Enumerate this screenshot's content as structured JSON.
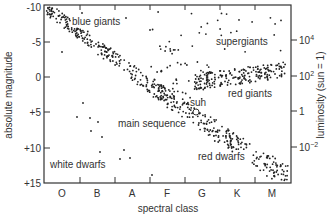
{
  "chart_data": {
    "type": "scatter",
    "xlabel": "spectral class",
    "ylabel_left": "absolute magnitude",
    "ylabel_right": "luminosity (sun = 1)",
    "x_categories": [
      "O",
      "B",
      "A",
      "F",
      "G",
      "K",
      "M"
    ],
    "y_left_ticks": [
      "-10",
      "-5",
      "0",
      "+5",
      "+10",
      "+15"
    ],
    "y_right_ticks": [
      {
        "base": "10",
        "exp": "4"
      },
      {
        "base": "10",
        "exp": "2"
      },
      {
        "base": "1",
        "exp": ""
      },
      {
        "base": "10",
        "exp": "−2"
      }
    ],
    "ylim_left": [
      -10,
      15
    ],
    "annotations": {
      "blue_giants": "blue giants",
      "supergiants": "supergiants",
      "red_giants": "red giants",
      "sun": "sun",
      "main_sequence": "main sequence",
      "white_dwarfs": "white dwarfs",
      "red_dwarfs": "red dwarfs"
    },
    "regions": [
      {
        "name": "main sequence",
        "from": {
          "class": "O",
          "mag": -9.5
        },
        "to": {
          "class": "M",
          "mag": 14.5
        }
      },
      {
        "name": "red giants",
        "class_range": [
          "G",
          "M"
        ],
        "mag_range": [
          -2,
          1
        ]
      },
      {
        "name": "supergiants",
        "class_range": [
          "F",
          "M"
        ],
        "mag_range": [
          -10,
          -3
        ]
      },
      {
        "name": "white dwarfs",
        "class_range": [
          "B",
          "F"
        ],
        "mag_range": [
          7,
          14
        ]
      },
      {
        "name": "red dwarfs",
        "class_range": [
          "K",
          "M"
        ],
        "mag_range": [
          9,
          15
        ]
      }
    ]
  }
}
